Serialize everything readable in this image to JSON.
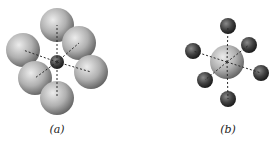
{
  "figure": {
    "panels": [
      {
        "id": "a",
        "label": "(a)",
        "center_atom": {
          "x": 57,
          "y": 62,
          "r": 7,
          "shade": "dark"
        },
        "ligands": [
          {
            "x": 57,
            "y": 25,
            "r": 17
          },
          {
            "x": 79,
            "y": 43,
            "r": 17
          },
          {
            "x": 23,
            "y": 50,
            "r": 17
          },
          {
            "x": 91,
            "y": 72,
            "r": 17
          },
          {
            "x": 35,
            "y": 78,
            "r": 17
          },
          {
            "x": 57,
            "y": 98,
            "r": 17
          }
        ],
        "ligand_shade": "light"
      },
      {
        "id": "b",
        "label": "(b)",
        "center_atom": {
          "x": 227,
          "y": 62,
          "r": 17,
          "shade": "light"
        },
        "ligands": [
          {
            "x": 228,
            "y": 26,
            "r": 8
          },
          {
            "x": 249,
            "y": 45,
            "r": 8
          },
          {
            "x": 193,
            "y": 51,
            "r": 8
          },
          {
            "x": 261,
            "y": 73,
            "r": 8
          },
          {
            "x": 205,
            "y": 80,
            "r": 8
          },
          {
            "x": 228,
            "y": 99,
            "r": 8
          }
        ],
        "ligand_shade": "dark"
      }
    ],
    "colors": {
      "light_sphere_hi": "#e6e6e6",
      "light_sphere_lo": "#6a6a6a",
      "dark_sphere_hi": "#8a8a8a",
      "dark_sphere_lo": "#1e1e1e",
      "bond": "#2a2a2a"
    }
  }
}
